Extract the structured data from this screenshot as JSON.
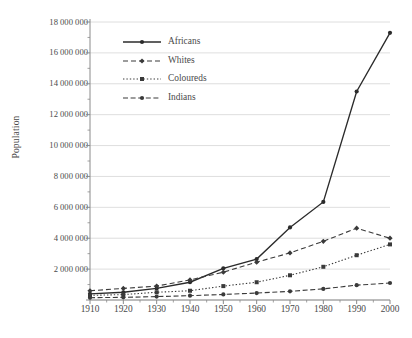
{
  "chart_data": {
    "type": "line",
    "title": "",
    "xlabel": "",
    "ylabel": "Population",
    "x": [
      1910,
      1920,
      1930,
      1940,
      1950,
      1960,
      1970,
      1980,
      1990,
      2000
    ],
    "xtick_labels": [
      "1910",
      "1920",
      "1930",
      "1940",
      "1950",
      "1960",
      "1970",
      "1980",
      "1990",
      "2000"
    ],
    "ytick_labels": [
      "0",
      "2 000 000",
      "4 000 000",
      "6 000 000",
      "8 000 000",
      "10 000 000",
      "12 000 000",
      "14 000 000",
      "16 000 000",
      "18 000 000"
    ],
    "ytick_values": [
      0,
      2000000,
      4000000,
      6000000,
      8000000,
      10000000,
      12000000,
      14000000,
      16000000,
      18000000
    ],
    "ylim": [
      0,
      18000000
    ],
    "xlim": [
      1910,
      2000
    ],
    "grid": "horizontal",
    "minor_ticks": true,
    "legend_position": "top-left-inside",
    "series": [
      {
        "name": "Africans",
        "style": "solid",
        "marker": "filled-circle",
        "color": "#2b2b2b",
        "values": [
          4000000,
          4700000,
          5600000,
          6600000,
          8600000,
          10900000,
          15100000,
          21100000,
          28400000,
          35400000
        ],
        "plot_values": [
          400000,
          500000,
          750000,
          1150000,
          2050000,
          2650000,
          4700000,
          6350000,
          13500000,
          17300000
        ]
      },
      {
        "name": "Whites",
        "style": "dashed",
        "marker": "filled-diamond",
        "color": "#3a3a3a",
        "plot_values": [
          600000,
          750000,
          900000,
          1300000,
          1800000,
          2450000,
          3050000,
          3800000,
          4650000,
          4000000
        ]
      },
      {
        "name": "Coloureds",
        "style": "dotted",
        "marker": "filled-square",
        "color": "#3a3a3a",
        "plot_values": [
          300000,
          350000,
          500000,
          600000,
          900000,
          1150000,
          1600000,
          2150000,
          2900000,
          3600000
        ]
      },
      {
        "name": "Indians",
        "style": "dash-dot",
        "marker": "filled-circle",
        "color": "#3a3a3a",
        "plot_values": [
          150000,
          170000,
          220000,
          280000,
          360000,
          450000,
          560000,
          720000,
          960000,
          1100000
        ]
      }
    ],
    "legend_entries": [
      "Africans",
      "Whites",
      "Coloureds",
      "Indians"
    ]
  },
  "axes": {
    "y_label": "Population"
  },
  "colors": {
    "line": "#2b2b2b",
    "grid": "#d6d6d6",
    "axis": "#8a8a8a",
    "text": "#4a4a4a",
    "background": "#ffffff"
  }
}
